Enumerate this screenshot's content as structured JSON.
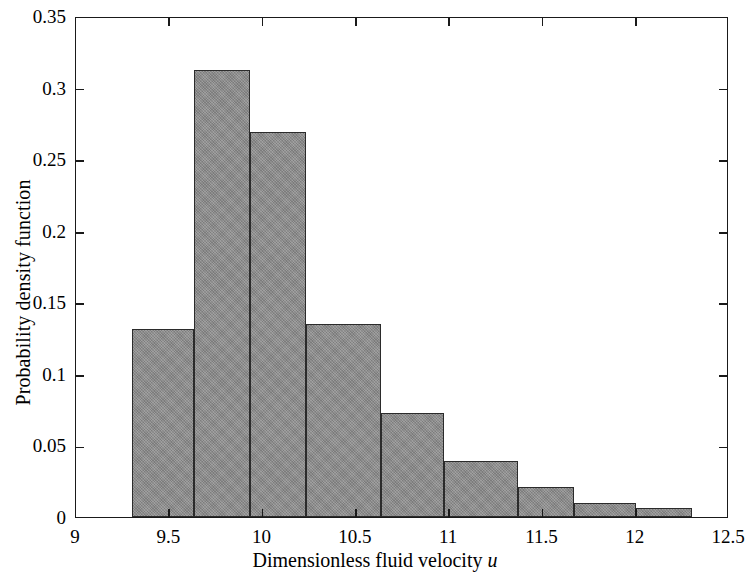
{
  "chart_data": {
    "type": "bar",
    "title": "",
    "subtitle": "",
    "xlabel": "Dimensionless fluid velocity u",
    "xlabel_plain": "Dimensionless fluid velocity",
    "xlabel_italic_symbol": "u",
    "ylabel": "Probability density function",
    "xlim": [
      9,
      12.5
    ],
    "ylim": [
      0,
      0.35
    ],
    "xticks": [
      9,
      9.5,
      10,
      10.5,
      11,
      11.5,
      12,
      12.5
    ],
    "xtick_labels": [
      "9",
      "9.5",
      "10",
      "10.5",
      "11",
      "11.5",
      "12",
      "12.5"
    ],
    "yticks": [
      0,
      0.05,
      0.1,
      0.15,
      0.2,
      0.25,
      0.3,
      0.35
    ],
    "ytick_labels": [
      "0",
      "0.05",
      "0.1",
      "0.15",
      "0.2",
      "0.25",
      "0.3",
      "0.35"
    ],
    "grid": false,
    "legend": null,
    "legend_position": "none",
    "bin_edges": [
      9.3,
      9.6,
      9.634,
      9.935,
      10.235,
      10.535,
      10.835,
      11.136,
      11.436,
      11.736,
      12.3
    ],
    "bins": [
      {
        "x_start": 9.3,
        "x_end": 9.634,
        "value": 0.131
      },
      {
        "x_start": 9.634,
        "x_end": 9.935,
        "value": 0.312
      },
      {
        "x_start": 9.935,
        "x_end": 10.235,
        "value": 0.269
      },
      {
        "x_start": 10.235,
        "x_end": 10.635,
        "value": 0.135
      },
      {
        "x_start": 10.635,
        "x_end": 10.97,
        "value": 0.073
      },
      {
        "x_start": 10.97,
        "x_end": 11.37,
        "value": 0.039
      },
      {
        "x_start": 11.37,
        "x_end": 11.67,
        "value": 0.021
      },
      {
        "x_start": 11.67,
        "x_end": 12.0,
        "value": 0.0095
      },
      {
        "x_start": 12.0,
        "x_end": 12.3,
        "value": 0.006
      }
    ],
    "values": [
      0.131,
      0.312,
      0.269,
      0.135,
      0.073,
      0.039,
      0.021,
      0.0095,
      0.006
    ],
    "categories": [
      "9.30-9.63",
      "9.63-9.94",
      "9.94-10.24",
      "10.24-10.64",
      "10.64-10.97",
      "10.97-11.37",
      "11.37-11.67",
      "11.67-12.00",
      "12.00-12.30"
    ],
    "colors": {
      "bar_fill": "#8c8c8c",
      "bar_edge": "#2b2b2b",
      "axis": "#1a1a1a",
      "background": "#ffffff",
      "text": "#000000"
    }
  }
}
